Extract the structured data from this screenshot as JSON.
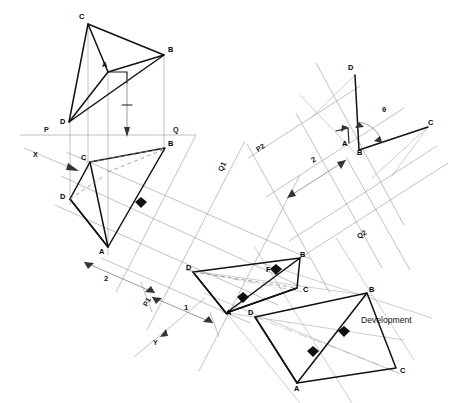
{
  "drawing": {
    "title": "Development of a tetrahedron — auxiliary projection",
    "annotations": {
      "development_label": "Development",
      "angle_label": "θ"
    },
    "reference_lines": [
      {
        "name": "P",
        "label": "P",
        "x": 44,
        "y": 132
      },
      {
        "name": "Q",
        "label": "Q",
        "x": 173,
        "y": 132
      },
      {
        "name": "Q1",
        "label": "Q1",
        "x": 222,
        "y": 172
      },
      {
        "name": "P2",
        "label": "P2",
        "x": 258,
        "y": 152
      },
      {
        "name": "Q2",
        "label": "Q2",
        "x": 359,
        "y": 239
      },
      {
        "name": "X",
        "label": "X",
        "x": 33,
        "y": 157
      },
      {
        "name": "Y",
        "label": "Y",
        "x": 153,
        "y": 345
      },
      {
        "name": "P1",
        "label": "P1",
        "x": 147,
        "y": 307
      }
    ],
    "dimensions": [
      {
        "name": "dim-2-left",
        "label": "2",
        "x": 104,
        "y": 281
      },
      {
        "name": "dim-1-left",
        "label": "1",
        "x": 184,
        "y": 310
      },
      {
        "name": "dim-2-right",
        "label": "2",
        "x": 313,
        "y": 163
      }
    ],
    "views": [
      {
        "name": "front-view",
        "vertices": [
          {
            "label": "C",
            "lx": 79,
            "ly": 19
          },
          {
            "label": "B",
            "lx": 168,
            "ly": 52
          },
          {
            "label": "A",
            "lx": 102,
            "ly": 67
          },
          {
            "label": "D",
            "lx": 60,
            "ly": 124
          }
        ]
      },
      {
        "name": "top-view",
        "vertices": [
          {
            "label": "B",
            "lx": 168,
            "ly": 146
          },
          {
            "label": "C",
            "lx": 81,
            "ly": 160
          },
          {
            "label": "D",
            "lx": 60,
            "ly": 199
          },
          {
            "label": "A",
            "lx": 99,
            "ly": 254
          }
        ]
      },
      {
        "name": "auxiliary-view",
        "vertices": [
          {
            "label": "B",
            "lx": 300,
            "ly": 257
          },
          {
            "label": "F",
            "lx": 266,
            "ly": 272
          },
          {
            "label": "C",
            "lx": 303,
            "ly": 292
          },
          {
            "label": "D",
            "lx": 186,
            "ly": 270
          },
          {
            "label": "E",
            "lx": 240,
            "ly": 301
          },
          {
            "label": "A",
            "lx": 226,
            "ly": 315
          }
        ]
      },
      {
        "name": "true-shape-view",
        "vertices": [
          {
            "label": "D",
            "lx": 248,
            "ly": 315
          },
          {
            "label": "A",
            "lx": 294,
            "ly": 391
          },
          {
            "label": "B",
            "lx": 369,
            "ly": 292
          },
          {
            "label": "C",
            "lx": 400,
            "ly": 373
          }
        ]
      },
      {
        "name": "angle-view",
        "vertices": [
          {
            "label": "D",
            "lx": 348,
            "ly": 70
          },
          {
            "label": "C",
            "lx": 428,
            "ly": 125
          },
          {
            "label": "A",
            "lx": 342,
            "ly": 146
          },
          {
            "label": "B",
            "lx": 357,
            "ly": 155
          }
        ]
      }
    ]
  }
}
